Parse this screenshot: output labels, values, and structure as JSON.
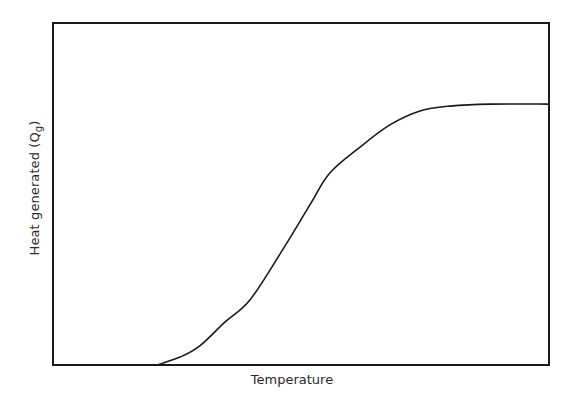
{
  "chart_data": {
    "type": "line",
    "title": "",
    "xlabel": "Temperature",
    "ylabel": "Heat generated (Qg)",
    "ylabel_parts": {
      "main": "Heat generated (Q",
      "subscript": "g",
      "close": ")"
    },
    "xlim": [
      0,
      100
    ],
    "ylim": [
      0,
      100
    ],
    "x_ticks": [],
    "y_ticks": [],
    "grid": false,
    "legend": null,
    "series": [
      {
        "name": "Heat generated",
        "color": "#1a1a1a",
        "x": [
          0,
          21,
          25.6,
          29.6,
          34.7,
          39.7,
          46,
          51.8,
          55.8,
          61.9,
          67.9,
          74,
          80,
          88.1,
          100
        ],
        "y": [
          0,
          0,
          2.3,
          5.6,
          12.6,
          19,
          33,
          46.8,
          56.1,
          63.7,
          70.2,
          74.3,
          75.7,
          76.3,
          76.3
        ]
      }
    ]
  },
  "colors": {
    "frame": "#1a1a1a",
    "curve": "#1a1a1a",
    "text": "#2a2a2a",
    "background": "#ffffff"
  }
}
